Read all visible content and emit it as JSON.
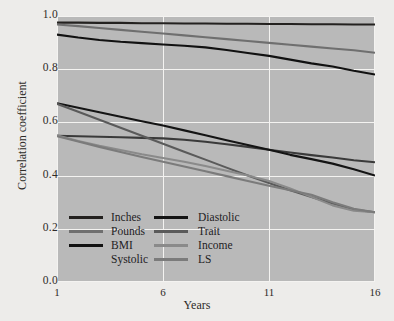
{
  "chart_data": {
    "type": "line",
    "title": "",
    "xlabel": "Years",
    "ylabel": "Correlation coefficient",
    "xlim": [
      1,
      16
    ],
    "ylim": [
      0.0,
      1.0
    ],
    "xticks": [
      "1",
      "6",
      "11",
      "16"
    ],
    "xtick_values": [
      1,
      6,
      11,
      16
    ],
    "yticks": [
      "0.0",
      "0.2",
      "0.4",
      "0.6",
      "0.8",
      "1.0"
    ],
    "ytick_values": [
      0.0,
      0.2,
      0.4,
      0.6,
      0.8,
      1.0
    ],
    "grid": true,
    "legend_position": "lower-left-inside",
    "plot_background": "#b9b9b9",
    "grid_color": "#f4f3f1",
    "figure_background": "#edecea",
    "x": [
      1,
      2,
      3,
      4,
      5,
      6,
      7,
      8,
      9,
      10,
      11,
      12,
      13,
      14,
      15,
      16
    ],
    "series": [
      {
        "name": "Inches",
        "color": "#23211f",
        "values": [
          0.975,
          0.975,
          0.974,
          0.974,
          0.973,
          0.973,
          0.972,
          0.972,
          0.971,
          0.971,
          0.97,
          0.97,
          0.969,
          0.969,
          0.968,
          0.968
        ]
      },
      {
        "name": "Pounds",
        "color": "#6f6f6f",
        "values": [
          0.968,
          0.962,
          0.955,
          0.948,
          0.941,
          0.934,
          0.927,
          0.92,
          0.913,
          0.906,
          0.899,
          0.892,
          0.885,
          0.878,
          0.871,
          0.862
        ]
      },
      {
        "name": "BMI",
        "color": "#111111",
        "values": [
          0.93,
          0.919,
          0.91,
          0.903,
          0.898,
          0.893,
          0.888,
          0.882,
          0.872,
          0.861,
          0.85,
          0.836,
          0.822,
          0.81,
          0.794,
          0.78
        ]
      },
      {
        "name": "Systolic",
        "color": "#3a3a3a",
        "values": [
          0.55,
          0.548,
          0.546,
          0.544,
          0.542,
          0.54,
          0.535,
          0.527,
          0.518,
          0.508,
          0.497,
          0.487,
          0.477,
          0.468,
          0.458,
          0.45
        ]
      },
      {
        "name": "Diastolic",
        "color": "#141414",
        "values": [
          0.672,
          0.655,
          0.638,
          0.621,
          0.604,
          0.588,
          0.57,
          0.552,
          0.533,
          0.515,
          0.497,
          0.478,
          0.462,
          0.445,
          0.424,
          0.4
        ]
      },
      {
        "name": "Trait",
        "color": "#5a5a5a",
        "values": [
          0.67,
          0.64,
          0.61,
          0.58,
          0.55,
          0.52,
          0.49,
          0.46,
          0.43,
          0.4,
          0.372,
          0.345,
          0.32,
          0.295,
          0.272,
          0.262
        ]
      },
      {
        "name": "Income",
        "color": "#8a8a8a",
        "values": [
          0.552,
          0.53,
          0.512,
          0.496,
          0.48,
          0.466,
          0.452,
          0.436,
          0.418,
          0.4,
          0.38,
          0.352,
          0.32,
          0.288,
          0.268,
          0.262
        ]
      },
      {
        "name": "LS",
        "color": "#7b7b7b",
        "values": [
          0.548,
          0.528,
          0.508,
          0.489,
          0.47,
          0.452,
          0.434,
          0.416,
          0.398,
          0.38,
          0.362,
          0.345,
          0.328,
          0.3,
          0.275,
          0.262
        ]
      }
    ],
    "legend_entries": [
      {
        "label": "Inches",
        "color": "#23211f",
        "has_swatch": true,
        "column": "left"
      },
      {
        "label": "Pounds",
        "color": "#6f6f6f",
        "has_swatch": true,
        "column": "left"
      },
      {
        "label": "BMI",
        "color": "#111111",
        "has_swatch": true,
        "column": "left"
      },
      {
        "label": "Systolic",
        "color": "#3a3a3a",
        "has_swatch": false,
        "column": "left"
      },
      {
        "label": "Diastolic",
        "color": "#141414",
        "has_swatch": true,
        "column": "right"
      },
      {
        "label": "Trait",
        "color": "#5a5a5a",
        "has_swatch": true,
        "column": "right"
      },
      {
        "label": "Income",
        "color": "#8a8a8a",
        "has_swatch": true,
        "column": "right"
      },
      {
        "label": "LS",
        "color": "#7b7b7b",
        "has_swatch": true,
        "column": "right"
      }
    ]
  }
}
